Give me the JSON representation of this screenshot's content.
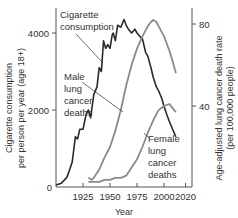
{
  "chart_data": {
    "type": "line",
    "title": "",
    "xlabel": "Year",
    "ylabel_left": "Cigarette consumption per person per year (age 18+)",
    "ylabel_left_lines": [
      "Cigarette consumption",
      "per person per year (age 18+)"
    ],
    "ylabel_right": "Age-adjusted lung cancer death rate (per 100,000 people)",
    "ylabel_right_lines": [
      "Age-adjusted lung cancer death rate",
      "(per 100,000 people)"
    ],
    "xlim": [
      1900,
      2025
    ],
    "ylim_left": [
      0,
      4700
    ],
    "ylim_right": [
      0,
      90
    ],
    "x_ticks": [
      1925,
      1950,
      1975,
      2000,
      2020
    ],
    "y_left_ticks": [
      0,
      2000,
      4000
    ],
    "y_right_ticks": [
      40,
      80
    ],
    "grid": false,
    "series": [
      {
        "name": "Cigarette consumption",
        "axis": "left",
        "color": "#2a2a2a",
        "x": [
          1900,
          1905,
          1910,
          1912,
          1915,
          1918,
          1920,
          1922,
          1925,
          1928,
          1930,
          1932,
          1935,
          1938,
          1940,
          1942,
          1944,
          1946,
          1948,
          1950,
          1952,
          1953,
          1955,
          1957,
          1960,
          1963,
          1965,
          1967,
          1970,
          1973,
          1975,
          1978,
          1980,
          1983,
          1985,
          1988,
          1990,
          1993,
          1995,
          1998,
          2000,
          2003,
          2005,
          2008,
          2011
        ],
        "values": [
          50,
          100,
          250,
          400,
          650,
          1300,
          1250,
          1500,
          1500,
          1900,
          2000,
          1800,
          2400,
          2600,
          3100,
          3000,
          3800,
          3600,
          3700,
          3600,
          3950,
          4000,
          3800,
          4200,
          4150,
          4350,
          4200,
          4100,
          4000,
          4100,
          4000,
          3900,
          3850,
          3500,
          3400,
          3100,
          2850,
          2600,
          2500,
          2300,
          2100,
          1850,
          1700,
          1500,
          1300
        ]
      },
      {
        "name": "Male lung cancer deaths",
        "axis": "right",
        "color": "#8a8a8a",
        "x": [
          1930,
          1933,
          1935,
          1940,
          1945,
          1950,
          1955,
          1960,
          1965,
          1970,
          1975,
          1980,
          1985,
          1988,
          1990,
          1993,
          1995,
          2000,
          2005,
          2008,
          2011
        ],
        "values": [
          5,
          4,
          5,
          9,
          15,
          20,
          28,
          38,
          50,
          60,
          68,
          74,
          79,
          81,
          82,
          81,
          79,
          74,
          67,
          62,
          56
        ]
      },
      {
        "name": "Female lung cancer deaths",
        "axis": "right",
        "color": "#8a8a8a",
        "x": [
          1930,
          1935,
          1940,
          1945,
          1950,
          1955,
          1960,
          1965,
          1970,
          1975,
          1980,
          1985,
          1990,
          1995,
          2000,
          2005,
          2008,
          2011
        ],
        "values": [
          3,
          3,
          3,
          4,
          4,
          5,
          5,
          6,
          10,
          14,
          20,
          27,
          33,
          38,
          40,
          41,
          39,
          37
        ]
      }
    ],
    "annotations": [
      {
        "text_lines": [
          "Cigarette",
          "consumption"
        ],
        "target_series": "Cigarette consumption"
      },
      {
        "text_lines": [
          "Male",
          "lung",
          "cancer",
          "deaths"
        ],
        "target_series": "Male lung cancer deaths"
      },
      {
        "text_lines": [
          "Female",
          "lung",
          "cancer",
          "deaths"
        ],
        "target_series": "Female lung cancer deaths"
      }
    ]
  }
}
